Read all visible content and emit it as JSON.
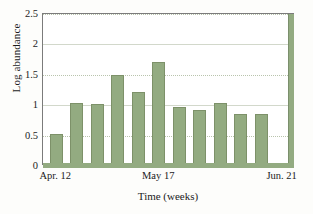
{
  "chart_data": {
    "type": "bar",
    "title": "",
    "xlabel": "Time (weeks)",
    "ylabel": "Log abundance",
    "ylim": [
      0,
      2.5
    ],
    "yticks": [
      "0",
      "0.5",
      "1",
      "1.5",
      "2",
      "2.5"
    ],
    "ytick_values": [
      0,
      0.5,
      1,
      1.5,
      2,
      2.5
    ],
    "grid": true,
    "legend": null,
    "xtick_labels": [
      "Apr. 12",
      "May 17",
      "Jun. 21"
    ],
    "xtick_positions": [
      0,
      5,
      11
    ],
    "categories": [
      "1",
      "2",
      "3",
      "4",
      "5",
      "6",
      "7",
      "8",
      "9",
      "10",
      "11",
      "12"
    ],
    "values": [
      0.49,
      1.0,
      0.99,
      1.47,
      1.19,
      1.67,
      0.93,
      0.89,
      1.01,
      0.83,
      0.82,
      2.5
    ],
    "series": [
      {
        "name": "Log abundance",
        "values": [
          0.49,
          1.0,
          0.99,
          1.47,
          1.19,
          1.67,
          0.93,
          0.89,
          1.01,
          0.83,
          0.82,
          2.5
        ]
      }
    ],
    "colors": {
      "bar_fill": "#93ab81",
      "bar_edge": "#7d9169",
      "frame": "#7b7b7b",
      "grid": "#b9c4ad",
      "background": "#fdfdfb",
      "plot_background": "#ffffff",
      "text": "#1b1b1b"
    }
  }
}
